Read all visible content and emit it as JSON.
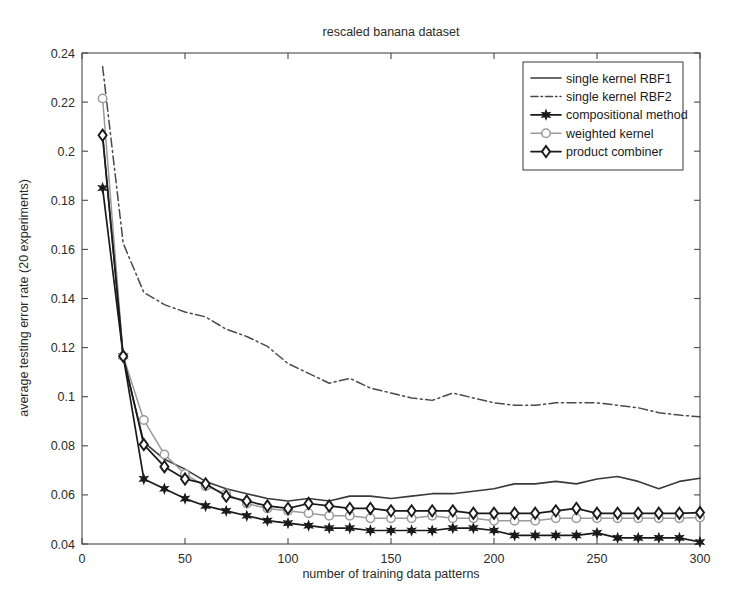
{
  "chart_data": {
    "type": "line",
    "title": "rescaled banana dataset",
    "xlabel": "number of training data patterns",
    "ylabel": "average testing error rate (20 experiments)",
    "xlim": [
      0,
      300
    ],
    "ylim": [
      0.04,
      0.24
    ],
    "xticks": [
      0,
      50,
      100,
      150,
      200,
      250,
      300
    ],
    "xticklabels": [
      "0",
      "50",
      "100",
      "150",
      "200",
      "250",
      "300"
    ],
    "yticks": [
      0.04,
      0.06,
      0.08,
      0.1,
      0.12,
      0.14,
      0.16,
      0.18,
      0.2,
      0.22,
      0.24
    ],
    "yticklabels": [
      "0.04",
      "0.06",
      "0.08",
      "0.1",
      "0.12",
      "0.14",
      "0.16",
      "0.18",
      "0.2",
      "0.22",
      "0.24"
    ],
    "grid": false,
    "legend_position": "top-right",
    "series": [
      {
        "name": "single kernel RBF1",
        "style": "solid",
        "marker": "none",
        "color": "#3a3a3a",
        "width": 1.6,
        "x": [
          10,
          20,
          30,
          40,
          50,
          60,
          70,
          80,
          90,
          100,
          110,
          120,
          130,
          140,
          150,
          160,
          170,
          180,
          190,
          200,
          210,
          220,
          230,
          240,
          250,
          260,
          270,
          280,
          290,
          300
        ],
        "y": [
          0.206,
          0.116,
          0.0815,
          0.0745,
          0.0705,
          0.0655,
          0.0625,
          0.0605,
          0.0585,
          0.0575,
          0.0585,
          0.0575,
          0.0595,
          0.0595,
          0.0585,
          0.0595,
          0.0605,
          0.0605,
          0.0615,
          0.0625,
          0.0645,
          0.0645,
          0.0655,
          0.0645,
          0.0665,
          0.0675,
          0.0655,
          0.0625,
          0.0655,
          0.0668
        ]
      },
      {
        "name": "single kernel RBF2",
        "style": "dashdot",
        "marker": "none",
        "color": "#4a4a4a",
        "width": 1.5,
        "x": [
          10,
          20,
          30,
          40,
          50,
          60,
          70,
          80,
          90,
          100,
          110,
          120,
          130,
          140,
          150,
          160,
          170,
          180,
          190,
          200,
          210,
          220,
          230,
          240,
          250,
          260,
          270,
          280,
          290,
          300
        ],
        "y": [
          0.2345,
          0.1625,
          0.1425,
          0.1375,
          0.1345,
          0.1325,
          0.1275,
          0.1245,
          0.1205,
          0.1135,
          0.1095,
          0.1055,
          0.1075,
          0.1035,
          0.1015,
          0.0995,
          0.0985,
          0.1015,
          0.0995,
          0.0975,
          0.0965,
          0.0965,
          0.0975,
          0.0975,
          0.0975,
          0.0965,
          0.0955,
          0.0935,
          0.0925,
          0.0918
        ]
      },
      {
        "name": "compositional method",
        "style": "solid",
        "marker": "star",
        "color": "#1a1a1a",
        "width": 1.7,
        "x": [
          10,
          20,
          30,
          40,
          50,
          60,
          70,
          80,
          90,
          100,
          110,
          120,
          130,
          140,
          150,
          160,
          170,
          180,
          190,
          200,
          210,
          220,
          230,
          240,
          250,
          260,
          270,
          280,
          290,
          300
        ],
        "y": [
          0.185,
          0.1165,
          0.0665,
          0.0625,
          0.0585,
          0.0555,
          0.0535,
          0.0515,
          0.0495,
          0.0485,
          0.0475,
          0.0465,
          0.0465,
          0.0455,
          0.0455,
          0.0455,
          0.0455,
          0.0465,
          0.0465,
          0.0455,
          0.0435,
          0.0435,
          0.0435,
          0.0435,
          0.0445,
          0.0425,
          0.0425,
          0.0425,
          0.0425,
          0.0408
        ]
      },
      {
        "name": "weighted kernel",
        "style": "solid",
        "marker": "circle",
        "color": "#9a9a9a",
        "width": 1.5,
        "x": [
          10,
          20,
          30,
          40,
          50,
          60,
          70,
          80,
          90,
          100,
          110,
          120,
          130,
          140,
          150,
          160,
          170,
          180,
          190,
          200,
          210,
          220,
          230,
          240,
          250,
          260,
          270,
          280,
          290,
          300
        ],
        "y": [
          0.2215,
          0.1165,
          0.0905,
          0.0765,
          0.0685,
          0.0635,
          0.0605,
          0.0565,
          0.0545,
          0.0535,
          0.0525,
          0.0515,
          0.0515,
          0.0505,
          0.0505,
          0.0505,
          0.0515,
          0.0505,
          0.0505,
          0.0495,
          0.0495,
          0.0495,
          0.0505,
          0.0505,
          0.0505,
          0.0505,
          0.0505,
          0.0505,
          0.0505,
          0.0508
        ]
      },
      {
        "name": "product combiner",
        "style": "solid",
        "marker": "diamond",
        "color": "#1a1a1a",
        "width": 1.7,
        "x": [
          10,
          20,
          30,
          40,
          50,
          60,
          70,
          80,
          90,
          100,
          110,
          120,
          130,
          140,
          150,
          160,
          170,
          180,
          190,
          200,
          210,
          220,
          230,
          240,
          250,
          260,
          270,
          280,
          290,
          300
        ],
        "y": [
          0.2065,
          0.1165,
          0.0805,
          0.0715,
          0.0665,
          0.0645,
          0.0595,
          0.0575,
          0.0555,
          0.0545,
          0.0565,
          0.0555,
          0.0545,
          0.0545,
          0.0535,
          0.0535,
          0.0535,
          0.0535,
          0.0525,
          0.0525,
          0.0525,
          0.0525,
          0.0535,
          0.0545,
          0.0525,
          0.0525,
          0.0525,
          0.0525,
          0.0525,
          0.0528
        ]
      }
    ]
  }
}
